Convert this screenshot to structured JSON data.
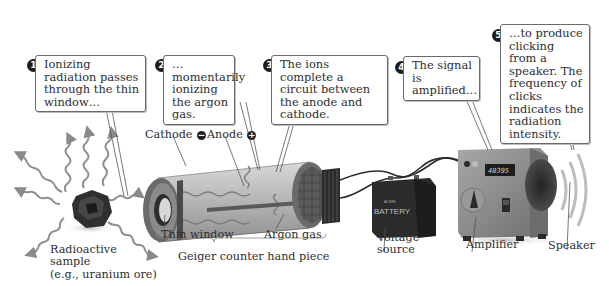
{
  "steps": [
    {
      "number": "1",
      "text": "Ionizing radiation passes through the thin window…"
    },
    {
      "number": "2",
      "text": "…momentarily ionizing the argon gas."
    },
    {
      "number": "3",
      "text": "The ions complete a circuit between the anode and cathode."
    },
    {
      "number": "4",
      "text": "The signal is amplified…"
    },
    {
      "number": "5",
      "text": "…to produce clicking from a speaker. The frequency of clicks indicates the radiation intensity."
    }
  ],
  "labels": {
    "cathode": "Cathode",
    "cathode_sign": "−",
    "anode": "Anode",
    "anode_sign": "+",
    "thin_window": "Thin window",
    "argon_gas": "Argon gas",
    "hand_piece": "Geiger counter hand piece",
    "sample_line1": "Radioactive",
    "sample_line2": "sample",
    "sample_line3": "(e.g., uranium ore)",
    "voltage_line1": "Voltage",
    "voltage_line2": "source",
    "amplifier": "Amplifier",
    "speaker": "Speaker",
    "battery_small": "ACME",
    "battery_text": "BATTERY",
    "amp_display": "40395"
  },
  "colors": {
    "ink": "#2a2a2a",
    "badge": "#1c1c1c",
    "callout_border": "#6a6a6a",
    "tube": "#a9a9a9",
    "battery": "#2b2b2b",
    "amplifier": "#8f8f8f"
  }
}
